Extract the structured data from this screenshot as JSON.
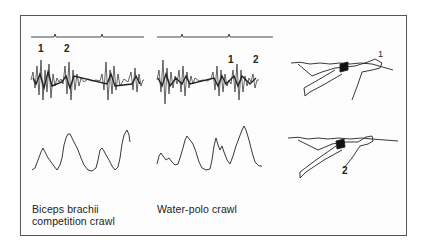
{
  "figure": {
    "panels": [
      {
        "id": "biceps-competition",
        "caption_line1": "Biceps brachii",
        "caption_line2": "competition crawl",
        "emg_markers": [
          "1",
          "2"
        ]
      },
      {
        "id": "water-polo",
        "caption_line1": "Water-polo crawl",
        "emg_markers": [
          "1",
          "2"
        ]
      }
    ],
    "illustrations": [
      {
        "id": "swimmer-phase-1",
        "marker": "1"
      },
      {
        "id": "swimmer-phase-2",
        "marker": "2"
      }
    ]
  }
}
